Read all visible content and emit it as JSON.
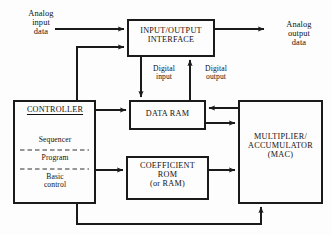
{
  "diagram": {
    "stroke_color": "#1a1a1a",
    "background_color": "#fdfdfd",
    "boxes": [
      {
        "id": "io_interface",
        "name": "input-output-interface-box",
        "label": "INPUT/OUTPUT\nINTERFACE",
        "x": 128,
        "y": 20,
        "w": 86,
        "h": 36
      },
      {
        "id": "data_ram",
        "name": "data-ram-box",
        "label": "DATA  RAM",
        "x": 130,
        "y": 101,
        "w": 75,
        "h": 28
      },
      {
        "id": "coefficient_rom",
        "name": "coefficient-rom-box",
        "label": "COEFFICIENT\nROM\n(or RAM)",
        "x": 127,
        "y": 157,
        "w": 81,
        "h": 42
      },
      {
        "id": "mac",
        "name": "multiplier-accumulator-box",
        "label": "MULTIPLIER/\nACCUMULATOR\n(MAC)",
        "x": 239,
        "y": 101,
        "w": 83,
        "h": 102
      },
      {
        "id": "controller",
        "name": "controller-box",
        "label": "CONTROLLER",
        "x": 14,
        "y": 101,
        "w": 81,
        "h": 102
      }
    ],
    "controller": {
      "heading": "CONTROLLER",
      "items": [
        {
          "label": "Sequencer"
        },
        {
          "label": "Program"
        },
        {
          "label": "Basic\ncontrol"
        }
      ],
      "divider_style": "dashed"
    },
    "edge_labels": {
      "analog_input": "Analog\ninput\ndata",
      "analog_output": "Analog\noutput\ndata",
      "digital_input": "Digital\ninput",
      "digital_output": "Digital\noutput"
    },
    "connections": [
      {
        "name": "analog-input-to-io",
        "from": "analog_input_source",
        "to": "io_interface",
        "arrow": true
      },
      {
        "name": "io-to-analog-output",
        "from": "io_interface",
        "to": "analog_output_sink",
        "arrow": true
      },
      {
        "name": "controller-to-io",
        "from": "controller",
        "to": "io_interface",
        "arrow": true
      },
      {
        "name": "io-to-data-ram-digital-input",
        "from": "io_interface",
        "to": "data_ram",
        "arrow": true,
        "label": "Digital input"
      },
      {
        "name": "data-ram-to-io-digital-output",
        "from": "data_ram",
        "to": "io_interface",
        "arrow": true,
        "label": "Digital output"
      },
      {
        "name": "controller-to-data-ram",
        "from": "controller",
        "to": "data_ram",
        "arrow": true
      },
      {
        "name": "controller-to-coefficient-rom",
        "from": "controller",
        "to": "coefficient_rom",
        "arrow": true
      },
      {
        "name": "mac-to-data-ram",
        "from": "mac",
        "to": "data_ram",
        "arrow": true
      },
      {
        "name": "data-ram-to-mac",
        "from": "data_ram",
        "to": "mac",
        "arrow": true
      },
      {
        "name": "coefficient-rom-to-mac",
        "from": "coefficient_rom",
        "to": "mac",
        "arrow": true
      },
      {
        "name": "controller-to-mac-feedback",
        "from": "controller",
        "to": "mac",
        "arrow": true
      }
    ]
  }
}
